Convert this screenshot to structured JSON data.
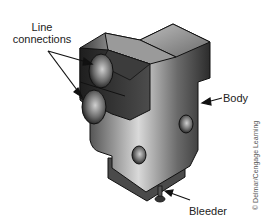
{
  "figure": {
    "labels": {
      "line_connections_1": "Line",
      "line_connections_2": "connections",
      "body": "Body",
      "bleeder": "Bleeder"
    },
    "credit": "© Delmar/Cengage Learning",
    "colors": {
      "background": "#ffffff",
      "part_dark": "#2a2a2a",
      "part_mid": "#6e6e6e",
      "part_light": "#c8c8c8",
      "label_text": "#222222"
    }
  }
}
